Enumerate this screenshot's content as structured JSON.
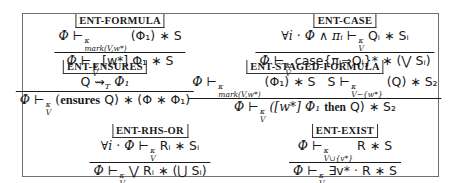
{
  "rules": [
    {
      "name": "ENT-FORMULA",
      "premises": [
        "Φ ⊢κ mark(V,w*) (Φ₁) ∗ S"
      ],
      "conclusion": "Φ ⊢κ V [w*] Φ₁ ∗ S",
      "parts": {
        "prem_lhs": "Φ",
        "prem_sub": "mark(V,w*)",
        "prem_sup": "κ",
        "prem_rhs": "(Φ₁) ∗ S",
        "concl_lhs": "Φ",
        "concl_sub": "V",
        "concl_sup": "κ",
        "concl_rhs": "[w*] Φ₁ ∗ S"
      }
    },
    {
      "name": "ENT-CASE",
      "premises": [
        "∀i · Φ ∧ πᵢ ⊢κ V Qᵢ ∗ Sᵢ"
      ],
      "conclusion": "Φ ⊢κ V case{πᵢ⇒Qᵢ}* ∗ (⋁ Sᵢ)",
      "parts": {
        "prem_lhs": "∀i · Φ ∧ πᵢ",
        "prem_sub": "V",
        "prem_sup": "κ",
        "prem_rhs": "Qᵢ ∗ Sᵢ",
        "concl_lhs": "Φ",
        "concl_sub": "V",
        "concl_sup": "κ",
        "concl_kw": "case",
        "concl_rhs": "{πᵢ⇒Qᵢ}* ∗ (⋁ Sᵢ)"
      }
    },
    {
      "name": "ENT-ENSURES",
      "premises": [
        "Q ⇝T Φ₁"
      ],
      "conclusion": "Φ ⊢κ V (ensures Q) ∗ (Φ ∗ Φ₁)",
      "parts": {
        "prem": "Q ⇝",
        "prem_sub": "T",
        "prem_rhs": "Φ₁",
        "concl_lhs": "Φ",
        "concl_sub": "V",
        "concl_sup": "κ",
        "concl_kw": "ensures",
        "concl_rhs_a": "(",
        "concl_rhs_b": "Q) ∗ (Φ ∗ Φ₁)"
      }
    },
    {
      "name": "ENT-STAGED-FORMULA",
      "premises": [
        "Φ ⊢κ mark(V,w*) (Φ₁) ∗ S",
        "S ⊢κ V−{w*} (Q) ∗ S₂"
      ],
      "conclusion": "Φ ⊢κ V ([w*] Φ₁ then Q) ∗ S₂",
      "parts": {
        "p1_lhs": "Φ",
        "p1_sub": "mark(V,w*)",
        "p1_sup": "κ",
        "p1_rhs": "(Φ₁) ∗ S",
        "p2_lhs": "S",
        "p2_sub": "V−{w*}",
        "p2_sup": "κ",
        "p2_rhs": "(Q) ∗ S₂",
        "concl_lhs": "Φ",
        "concl_sub": "V",
        "concl_sup": "κ",
        "concl_a": "([w*] Φ₁",
        "concl_kw": "then",
        "concl_b": "Q) ∗ S₂"
      }
    },
    {
      "name": "ENT-RHS-OR",
      "premises": [
        "∀i · Φ ⊢κ V Rᵢ ∗ Sᵢ"
      ],
      "conclusion": "Φ ⊢κ V ⋁ Rᵢ ∗ (⋃ Sᵢ)",
      "parts": {
        "prem_lhs": "∀i · Φ",
        "prem_sub": "V",
        "prem_sup": "κ",
        "prem_rhs": "Rᵢ ∗ Sᵢ",
        "concl_lhs": "Φ",
        "concl_sub": "V",
        "concl_sup": "κ",
        "concl_rhs": "⋁ Rᵢ ∗ (⋃ Sᵢ)"
      }
    },
    {
      "name": "ENT-EXIST",
      "premises": [
        "Φ ⊢κ V∪{v*} R ∗ S"
      ],
      "conclusion": "Φ ⊢κ V ∃v* · R ∗ S",
      "parts": {
        "prem_lhs": "Φ",
        "prem_sub": "V∪{v*}",
        "prem_sup": "κ",
        "prem_rhs": "R ∗ S",
        "concl_lhs": "Φ",
        "concl_sub": "V",
        "concl_sup": "κ",
        "concl_rhs": "∃v* · R ∗ S"
      }
    }
  ],
  "symbols": {
    "turnstile": "⊢"
  }
}
